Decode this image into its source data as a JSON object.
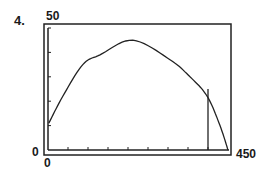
{
  "problem_number": "4.",
  "chart_data": {
    "type": "line",
    "title": "",
    "xlabel": "",
    "ylabel": "",
    "xlim": [
      0,
      450
    ],
    "ylim": [
      0,
      50
    ],
    "x_tick_labels": {
      "min": "0",
      "max": "450"
    },
    "y_tick_labels": {
      "min": "0",
      "max": "50"
    },
    "x_tick_step": 50,
    "y_tick_step": 10,
    "grid": false,
    "legend": null,
    "series": [
      {
        "name": "curve",
        "x": [
          2,
          37,
          87,
          130,
          212,
          305,
          355,
          398,
          430,
          450
        ],
        "y": [
          11,
          22,
          35,
          39,
          45,
          37,
          30,
          22,
          10,
          0
        ]
      }
    ],
    "annotations": [
      {
        "type": "vertical-line",
        "x": 400,
        "y_from": 0,
        "y_to": 25
      }
    ]
  }
}
